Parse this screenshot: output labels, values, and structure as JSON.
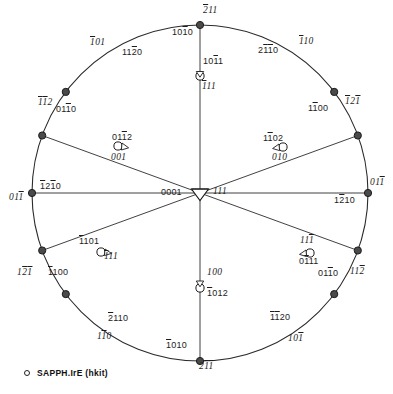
{
  "figure": {
    "circle": {
      "cx": 200,
      "cy": 193,
      "r": 168
    },
    "stroke_color": "#2b2b2b",
    "marker_fill": "#ffffff"
  },
  "legend": {
    "marker": "open-circle",
    "text": "SAPPH.IrE (hkit)"
  },
  "center": {
    "label_hkil": "0001",
    "label_cubic": "111"
  },
  "rim_poles": [
    {
      "name": "top",
      "angle_deg": 90,
      "hkil": "2̅ 1 1",
      "hkil_plain": "̅1010",
      "label_hkil": "1010",
      "label_cubic": "211",
      "cubic_bars": [
        0,
        1,
        1
      ],
      "hkil_bars": [
        0,
        0,
        1,
        0
      ]
    },
    {
      "name": "upper-left",
      "angle_deg": 143,
      "label_hkil": "1120",
      "label_cubic": "101",
      "cubic_bars": [
        1,
        0,
        0
      ],
      "hkil_bars": [
        0,
        0,
        1,
        0
      ]
    },
    {
      "name": "upper-right",
      "angle_deg": 37,
      "label_hkil": "2110",
      "label_cubic": "110",
      "cubic_bars": [
        1,
        0,
        0
      ],
      "hkil_bars": [
        0,
        1,
        1,
        0
      ]
    },
    {
      "name": "left-upper",
      "angle_deg": 160,
      "label_hkil": "0110",
      "label_cubic": "112",
      "cubic_bars": [
        1,
        1,
        0
      ],
      "hkil_bars": [
        0,
        0,
        1,
        0
      ]
    },
    {
      "name": "right-upper",
      "angle_deg": 20,
      "label_hkil": "1100",
      "label_cubic": "121",
      "cubic_bars": [
        1,
        0,
        1
      ],
      "hkil_bars": [
        0,
        1,
        0,
        0
      ]
    },
    {
      "name": "left",
      "angle_deg": 180,
      "label_hkil": "1210",
      "label_cubic": "011",
      "cubic_bars": [
        0,
        0,
        1
      ],
      "hkil_bars": [
        1,
        0,
        1,
        0
      ]
    },
    {
      "name": "right",
      "angle_deg": 0,
      "label_hkil": "1210",
      "label_cubic": "011",
      "cubic_bars": [
        0,
        0,
        1
      ],
      "hkil_bars": [
        0,
        1,
        0,
        0
      ]
    },
    {
      "name": "left-lower",
      "angle_deg": 200,
      "label_hkil": "1100",
      "label_cubic": "121",
      "cubic_bars": [
        0,
        1,
        1
      ],
      "hkil_bars": [
        1,
        0,
        0,
        0
      ]
    },
    {
      "name": "right-lower",
      "angle_deg": 340,
      "label_hkil": "0110",
      "label_cubic": "112",
      "cubic_bars": [
        0,
        0,
        1
      ],
      "hkil_bars": [
        0,
        0,
        1,
        0
      ]
    },
    {
      "name": "lower-left",
      "angle_deg": 217,
      "label_hkil": "2110",
      "label_cubic": "110",
      "cubic_bars": [
        0,
        1,
        0
      ],
      "hkil_bars": [
        1,
        0,
        0,
        0
      ]
    },
    {
      "name": "lower-right",
      "angle_deg": 323,
      "label_hkil": "1120",
      "label_cubic": "101",
      "cubic_bars": [
        0,
        0,
        1
      ],
      "hkil_bars": [
        1,
        1,
        0,
        0
      ]
    },
    {
      "name": "bottom",
      "angle_deg": 270,
      "label_hkil": "1010",
      "label_cubic": "211",
      "cubic_bars": [
        0,
        1,
        1
      ],
      "hkil_bars": [
        1,
        0,
        0,
        0
      ]
    }
  ],
  "interior_poles": [
    {
      "name": "top-inner",
      "label_hkil": "1011",
      "label_cubic": "111",
      "hkil_bars": [
        0,
        0,
        1,
        0
      ],
      "cubic_bars": [
        1,
        0,
        0
      ]
    },
    {
      "name": "upper-left-inner",
      "label_hkil": "0112",
      "label_cubic": "001",
      "hkil_bars": [
        0,
        0,
        1,
        0
      ],
      "cubic_bars": [
        0,
        0,
        0
      ]
    },
    {
      "name": "upper-right-inner",
      "label_hkil": "1102",
      "label_cubic": "010",
      "hkil_bars": [
        0,
        1,
        0,
        0
      ],
      "cubic_bars": [
        0,
        0,
        0
      ]
    },
    {
      "name": "lower-left-inner",
      "label_hkil": "1101",
      "label_cubic": "111",
      "hkil_bars": [
        1,
        0,
        0,
        0
      ],
      "cubic_bars": [
        1,
        0,
        0
      ]
    },
    {
      "name": "lower-right-inner",
      "label_hkil": "0111",
      "label_cubic": "111",
      "hkil_bars": [
        0,
        1,
        0,
        0
      ],
      "cubic_bars": [
        0,
        0,
        1
      ]
    },
    {
      "name": "bottom-inner",
      "label_hkil": "1012",
      "label_cubic": "100",
      "hkil_bars": [
        1,
        0,
        0,
        0
      ],
      "cubic_bars": [
        0,
        0,
        0
      ]
    }
  ],
  "labels": {
    "top_cubic": "211",
    "top_hkil": "1010",
    "top_inner_hkil": "1011",
    "top_inner_cubic": "111",
    "ul_cubic": "101",
    "ul_hkil": "1120",
    "ur_hkil": "2110",
    "ur_cubic": "110",
    "lu_cubic": "112",
    "lu_hkil": "0110",
    "ru_hkil": "1100",
    "ru_cubic": "121",
    "uli_hkil": "0112",
    "uli_cubic": "001",
    "uri_hkil": "1102",
    "uri_cubic": "010",
    "left_hkil": "1210",
    "left_cubic": "011",
    "center_hkil": "0001",
    "center_cubic": "111",
    "right_hkil": "1210",
    "right_cubic": "011",
    "lli_hkil": "1101",
    "lli_cubic": "111",
    "lri_cubic": "111",
    "lri_hkil": "0111",
    "ll_cubic": "121",
    "ll_hkil": "1100",
    "rl_hkil": "0110",
    "rl_cubic": "112",
    "bi_cubic": "100",
    "bi_hkil": "1012",
    "lowl_hkil": "2110",
    "lowl_cubic": "110",
    "lowr_hkil": "1120",
    "lowr_cubic": "101",
    "bot_hkil": "1010",
    "bot_cubic": "211"
  }
}
